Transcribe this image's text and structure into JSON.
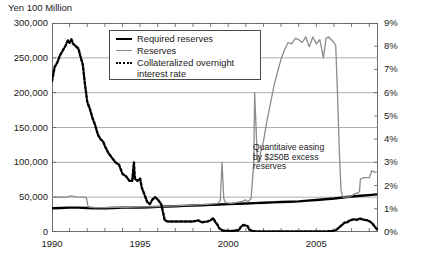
{
  "axis_title": "Yen 100 Million",
  "left_axis": {
    "ticks": [
      "300,000",
      "250,000",
      "200,000",
      "150,000",
      "100,000",
      "50,000",
      "0"
    ],
    "min": 0,
    "max": 300000
  },
  "right_axis": {
    "ticks": [
      "9%",
      "8%",
      "7%",
      "6%",
      "5%",
      "4%",
      "3%",
      "2%",
      "1%",
      "0%"
    ],
    "min": 0,
    "max": 9
  },
  "x_axis": {
    "ticks": [
      "1990",
      "1995",
      "2000",
      "2005"
    ],
    "min": 1990,
    "max": 2008.5
  },
  "legend": {
    "items": [
      {
        "label": "Required reserves",
        "swatch": "sw-required",
        "color": "#000000"
      },
      {
        "label": "Reserves",
        "swatch": "sw-reserves",
        "color": "#8c8c8c"
      },
      {
        "label": "Collateralized overnight interest rate",
        "swatch": "sw-rate",
        "color": "#000000"
      }
    ]
  },
  "annotation": {
    "text": "Quantitaive easing by $250B excess reserves"
  },
  "chart_data": {
    "type": "line",
    "title": "",
    "xlabel": "",
    "ylabel": "Yen 100 Million",
    "y2label": "%",
    "xlim": [
      1990,
      2008.5
    ],
    "ylim": [
      0,
      300000
    ],
    "y2lim": [
      0,
      9
    ],
    "grid": true,
    "legend_position": "top-center",
    "series": [
      {
        "name": "Required reserves",
        "axis": "left",
        "color": "#000000",
        "style": "solid-thick",
        "points": [
          [
            1990.0,
            34000
          ],
          [
            1990.5,
            34500
          ],
          [
            1991.0,
            35000
          ],
          [
            1991.5,
            35000
          ],
          [
            1992.0,
            34500
          ],
          [
            1992.5,
            34000
          ],
          [
            1993.0,
            34000
          ],
          [
            1993.5,
            34500
          ],
          [
            1994.0,
            35000
          ],
          [
            1994.5,
            35000
          ],
          [
            1995.0,
            35000
          ],
          [
            1995.5,
            35500
          ],
          [
            1996.0,
            36000
          ],
          [
            1996.5,
            36500
          ],
          [
            1997.0,
            37000
          ],
          [
            1997.5,
            37500
          ],
          [
            1998.0,
            38000
          ],
          [
            1998.5,
            38500
          ],
          [
            1999.0,
            39000
          ],
          [
            1999.5,
            39500
          ],
          [
            2000.0,
            40000
          ],
          [
            2000.5,
            40500
          ],
          [
            2001.0,
            41000
          ],
          [
            2001.5,
            41500
          ],
          [
            2002.0,
            42000
          ],
          [
            2002.5,
            42500
          ],
          [
            2003.0,
            43000
          ],
          [
            2003.5,
            43500
          ],
          [
            2004.0,
            44000
          ],
          [
            2004.5,
            45000
          ],
          [
            2005.0,
            46000
          ],
          [
            2005.5,
            47000
          ],
          [
            2006.0,
            48000
          ],
          [
            2006.5,
            49500
          ],
          [
            2007.0,
            51000
          ],
          [
            2007.5,
            52000
          ],
          [
            2008.0,
            53000
          ],
          [
            2008.4,
            54000
          ]
        ]
      },
      {
        "name": "Reserves",
        "axis": "left",
        "color": "#8c8c8c",
        "style": "solid-thin",
        "points": [
          [
            1990.0,
            50000
          ],
          [
            1990.4,
            50500
          ],
          [
            1990.8,
            50000
          ],
          [
            1991.1,
            52000
          ],
          [
            1991.4,
            50500
          ],
          [
            1991.7,
            50000
          ],
          [
            1991.95,
            49500
          ],
          [
            1992.05,
            36000
          ],
          [
            1992.4,
            35000
          ],
          [
            1993.0,
            35000
          ],
          [
            1993.6,
            35500
          ],
          [
            1994.2,
            35500
          ],
          [
            1995.0,
            36000
          ],
          [
            1996.0,
            36500
          ],
          [
            1997.0,
            37500
          ],
          [
            1998.0,
            38500
          ],
          [
            1999.0,
            40000
          ],
          [
            1999.4,
            41000
          ],
          [
            1999.55,
            45000
          ],
          [
            1999.65,
            100000
          ],
          [
            1999.75,
            48000
          ],
          [
            1999.85,
            42000
          ],
          [
            2000.2,
            41000
          ],
          [
            2000.8,
            44000
          ],
          [
            2001.0,
            46000
          ],
          [
            2001.1,
            43000
          ],
          [
            2001.3,
            48000
          ],
          [
            2001.45,
            100000
          ],
          [
            2001.5,
            200000
          ],
          [
            2001.58,
            150000
          ],
          [
            2001.65,
            105000
          ],
          [
            2001.72,
            100000
          ],
          [
            2001.85,
            115000
          ],
          [
            2002.0,
            130000
          ],
          [
            2002.2,
            160000
          ],
          [
            2002.4,
            185000
          ],
          [
            2002.6,
            210000
          ],
          [
            2002.8,
            230000
          ],
          [
            2003.0,
            248000
          ],
          [
            2003.2,
            262000
          ],
          [
            2003.4,
            272000
          ],
          [
            2003.6,
            270000
          ],
          [
            2003.8,
            278000
          ],
          [
            2004.0,
            276000
          ],
          [
            2004.2,
            272000
          ],
          [
            2004.4,
            280000
          ],
          [
            2004.6,
            266000
          ],
          [
            2004.8,
            280000
          ],
          [
            2005.0,
            270000
          ],
          [
            2005.2,
            276000
          ],
          [
            2005.4,
            250000
          ],
          [
            2005.55,
            278000
          ],
          [
            2005.7,
            280000
          ],
          [
            2005.85,
            276000
          ],
          [
            2006.0,
            272000
          ],
          [
            2006.1,
            268000
          ],
          [
            2006.2,
            200000
          ],
          [
            2006.3,
            120000
          ],
          [
            2006.4,
            60000
          ],
          [
            2006.5,
            50000
          ],
          [
            2006.8,
            50000
          ],
          [
            2007.0,
            52000
          ],
          [
            2007.2,
            55000
          ],
          [
            2007.35,
            56000
          ],
          [
            2007.45,
            58000
          ],
          [
            2007.5,
            76000
          ],
          [
            2007.7,
            78000
          ],
          [
            2008.0,
            78000
          ],
          [
            2008.15,
            88000
          ],
          [
            2008.3,
            86000
          ],
          [
            2008.4,
            86000
          ]
        ]
      },
      {
        "name": "Collateralized overnight interest rate",
        "axis": "right",
        "color": "#000000",
        "style": "dotted-thick",
        "points": [
          [
            1990.0,
            6.5
          ],
          [
            1990.15,
            7.1
          ],
          [
            1990.3,
            7.3
          ],
          [
            1990.45,
            7.6
          ],
          [
            1990.6,
            7.8
          ],
          [
            1990.75,
            8.0
          ],
          [
            1990.9,
            8.25
          ],
          [
            1991.0,
            8.15
          ],
          [
            1991.1,
            8.3
          ],
          [
            1991.2,
            8.1
          ],
          [
            1991.35,
            8.0
          ],
          [
            1991.5,
            7.9
          ],
          [
            1991.6,
            7.6
          ],
          [
            1991.75,
            7.2
          ],
          [
            1991.85,
            6.5
          ],
          [
            1992.0,
            5.6
          ],
          [
            1992.15,
            5.3
          ],
          [
            1992.3,
            4.9
          ],
          [
            1992.45,
            4.6
          ],
          [
            1992.6,
            4.2
          ],
          [
            1992.75,
            4.0
          ],
          [
            1992.9,
            3.9
          ],
          [
            1993.0,
            3.7
          ],
          [
            1993.2,
            3.4
          ],
          [
            1993.4,
            3.2
          ],
          [
            1993.6,
            3.0
          ],
          [
            1993.8,
            2.9
          ],
          [
            1994.0,
            2.5
          ],
          [
            1994.2,
            2.4
          ],
          [
            1994.4,
            2.2
          ],
          [
            1994.55,
            2.2
          ],
          [
            1994.65,
            3.0
          ],
          [
            1994.7,
            2.3
          ],
          [
            1994.85,
            2.2
          ],
          [
            1995.0,
            2.3
          ],
          [
            1995.1,
            1.9
          ],
          [
            1995.25,
            1.6
          ],
          [
            1995.4,
            1.3
          ],
          [
            1995.55,
            1.2
          ],
          [
            1995.7,
            1.4
          ],
          [
            1995.85,
            1.5
          ],
          [
            1996.0,
            1.4
          ],
          [
            1996.2,
            1.2
          ],
          [
            1996.4,
            0.5
          ],
          [
            1996.6,
            0.45
          ],
          [
            1997.0,
            0.45
          ],
          [
            1997.5,
            0.45
          ],
          [
            1998.0,
            0.45
          ],
          [
            1998.3,
            0.5
          ],
          [
            1998.5,
            0.42
          ],
          [
            1998.8,
            0.45
          ],
          [
            1999.0,
            0.5
          ],
          [
            1999.15,
            0.6
          ],
          [
            1999.25,
            0.45
          ],
          [
            1999.4,
            0.3
          ],
          [
            1999.5,
            0.15
          ],
          [
            1999.7,
            0.06
          ],
          [
            2000.0,
            0.05
          ],
          [
            2000.3,
            0.05
          ],
          [
            2000.6,
            0.08
          ],
          [
            2000.75,
            0.25
          ],
          [
            2000.85,
            0.3
          ],
          [
            2001.0,
            0.28
          ],
          [
            2001.1,
            0.25
          ],
          [
            2001.2,
            0.1
          ],
          [
            2001.35,
            0.05
          ],
          [
            2001.6,
            0.02
          ],
          [
            2002.0,
            0.02
          ],
          [
            2002.5,
            0.02
          ],
          [
            2003.0,
            0.02
          ],
          [
            2003.5,
            0.02
          ],
          [
            2004.0,
            0.02
          ],
          [
            2004.5,
            0.02
          ],
          [
            2005.0,
            0.02
          ],
          [
            2005.5,
            0.02
          ],
          [
            2006.0,
            0.05
          ],
          [
            2006.15,
            0.1
          ],
          [
            2006.3,
            0.2
          ],
          [
            2006.45,
            0.3
          ],
          [
            2006.6,
            0.4
          ],
          [
            2006.75,
            0.42
          ],
          [
            2006.9,
            0.5
          ],
          [
            2007.0,
            0.52
          ],
          [
            2007.15,
            0.55
          ],
          [
            2007.3,
            0.52
          ],
          [
            2007.45,
            0.58
          ],
          [
            2007.6,
            0.55
          ],
          [
            2007.75,
            0.52
          ],
          [
            2007.9,
            0.5
          ],
          [
            2008.05,
            0.45
          ],
          [
            2008.2,
            0.35
          ],
          [
            2008.35,
            0.2
          ],
          [
            2008.45,
            0.1
          ]
        ]
      }
    ]
  }
}
